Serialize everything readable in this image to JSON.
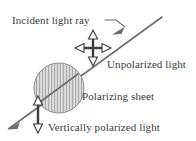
{
  "figure": {
    "background_color": "#ffffff",
    "ink_color": "#3b3b3b",
    "ray_color": "#6e6e6e",
    "sheet_fill_color": "#d9d9d9",
    "sheet_hatch_color": "#a8a8a8",
    "sheet_edge_color": "#8c8c8c"
  },
  "labels": {
    "incident_light_ray": "Incident light ray",
    "unpolarized_light": "Unpolarized light",
    "polarizing_sheet": "Polarizing sheet",
    "vertically_polarized_light": "Vertically polarized light"
  },
  "elements": {
    "light_ray": {
      "name": "light-ray",
      "description": "diagonal ray from upper right to lower left",
      "start": [
        162,
        17
      ],
      "end": [
        8,
        129
      ],
      "arrowheads": [
        [
          119,
          32
        ],
        [
          10,
          128
        ]
      ]
    },
    "unpolarized_arrow_cross": {
      "name": "unpolarized-arrow-cross",
      "center": [
        93,
        48
      ],
      "arm_length": 17,
      "directions": [
        "up",
        "down",
        "left",
        "right"
      ],
      "head_style": "hollow-triangle"
    },
    "polarizing_sheet_disc": {
      "name": "polarizing-sheet-disc",
      "center": [
        59,
        88
      ],
      "radius": 25,
      "hatch": "vertical-lines"
    },
    "polarized_arrow": {
      "name": "vertically-polarized-arrow",
      "x": 38,
      "top": 99,
      "bottom": 130,
      "head_style": "hollow-triangle",
      "directions": [
        "up",
        "down"
      ]
    },
    "leader_line": {
      "name": "incident-label-leader",
      "from": [
        106,
        20
      ],
      "to": [
        126,
        26
      ]
    }
  }
}
